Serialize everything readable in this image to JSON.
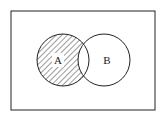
{
  "diagram": {
    "type": "venn",
    "universe_label": "",
    "sets": [
      {
        "name": "A",
        "label": "A",
        "cx": 63,
        "cy": 60,
        "r": 26
      },
      {
        "name": "B",
        "label": "B",
        "cx": 104,
        "cy": 60,
        "r": 26
      }
    ],
    "shaded_region": "A minus B",
    "colors": {
      "stroke": "#222222",
      "background": "#ffffff",
      "hatch": "#222222"
    }
  }
}
